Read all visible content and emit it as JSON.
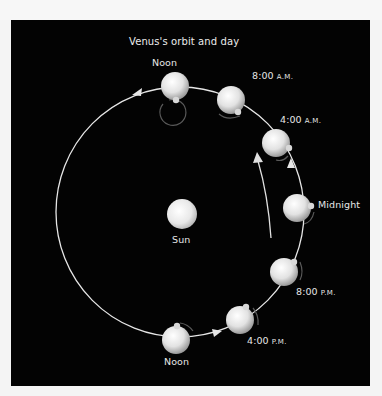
{
  "title": "Venus's orbit and day",
  "sun": {
    "label": "Sun"
  },
  "positions": [
    {
      "id": "noon-top",
      "time": "Noon",
      "suffix": ""
    },
    {
      "id": "8am",
      "time": "8:00",
      "suffix": "A.M."
    },
    {
      "id": "4am",
      "time": "4:00",
      "suffix": "A.M."
    },
    {
      "id": "midnight",
      "time": "Midnight",
      "suffix": ""
    },
    {
      "id": "8pm",
      "time": "8:00",
      "suffix": "P.M."
    },
    {
      "id": "4pm",
      "time": "4:00",
      "suffix": "P.M."
    },
    {
      "id": "noon-bottom",
      "time": "Noon",
      "suffix": ""
    }
  ],
  "colors": {
    "background": "#030303",
    "orbit": "#e8e8e8",
    "planet_light": "#f4f4f4",
    "planet_dark": "#9a9a9a",
    "rotation_arrow": "#5a5a5a",
    "text": "#e6e6e6"
  }
}
